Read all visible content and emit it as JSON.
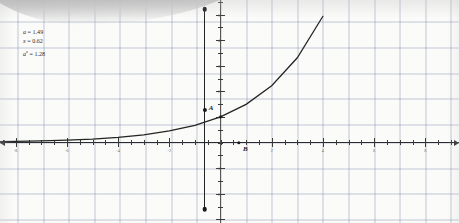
{
  "chart_data": {
    "type": "line",
    "title": "",
    "xlabel": "",
    "ylabel": "",
    "function": "y = a^x",
    "base_a": 1.49,
    "xlim": [
      -8.6,
      9.3
    ],
    "ylim": [
      -5.6,
      7.4
    ],
    "grid": true,
    "legend": false,
    "x_ticks": [
      -8,
      -6,
      -4,
      -2,
      2,
      4,
      6,
      8
    ],
    "y_ticks": [
      -5,
      -4,
      -3,
      -2,
      -1,
      1,
      2,
      3,
      4,
      5,
      6,
      7
    ],
    "x_tick_labels": [
      "-8",
      "-6",
      "-4",
      "-2",
      "2",
      "4",
      "6",
      "8"
    ],
    "y_tick_labels": [
      "-5",
      "-4",
      "-3",
      "-2",
      "-1",
      "1",
      "2",
      "3",
      "4",
      "5",
      "6",
      "7"
    ],
    "curve_points_x": [
      -8.6,
      -8,
      -7,
      -6,
      -5,
      -4,
      -3,
      -2,
      -1,
      0,
      1,
      2,
      3,
      4,
      5,
      6,
      6.6
    ],
    "curve_points_y": [
      0.03,
      0.04,
      0.06,
      0.09,
      0.13,
      0.2,
      0.3,
      0.45,
      0.67,
      1.0,
      1.49,
      2.22,
      3.31,
      4.93,
      7.35,
      10.95,
      14.3
    ],
    "series": [
      {
        "name": "y = a^x",
        "x": [
          -8.6,
          -8,
          -7,
          -6,
          -5,
          -4,
          -3,
          -2,
          -1,
          0,
          1,
          2,
          3,
          4,
          5,
          6,
          6.6
        ],
        "values": [
          0.03,
          0.04,
          0.06,
          0.09,
          0.13,
          0.2,
          0.3,
          0.45,
          0.67,
          1.0,
          1.49,
          2.22,
          3.31,
          4.93,
          7.35,
          10.95,
          14.3
        ]
      }
    ],
    "annotations": [
      {
        "name": "A",
        "label": "A",
        "x": -0.62,
        "y": 1.28,
        "style": "point-on-segment"
      },
      {
        "name": "B",
        "label": "B",
        "x": 0.72,
        "y": 0,
        "style": "point-on-x-axis"
      }
    ],
    "segments": [
      {
        "name": "vertical-slider",
        "x": -0.62,
        "y_start": 5.2,
        "y_end": -2.6,
        "endpoints": true
      }
    ]
  },
  "readout": {
    "lines": [
      {
        "name": "base-value",
        "var": "a",
        "sup": "",
        "eq": " = ",
        "value": "1.49"
      },
      {
        "name": "exponent-value",
        "var": "x",
        "sup": "",
        "eq": " = ",
        "value": "0.62"
      },
      {
        "name": "result-value",
        "var": "a",
        "sup": "x",
        "eq": " = ",
        "value": "1.28"
      }
    ],
    "line1": "a = 1.49",
    "line2": "x = 0.62",
    "line3": "aˣ = 1.28"
  },
  "points": {
    "a_label": "A",
    "b_label": "B"
  },
  "colors": {
    "curve": "#242424",
    "axis": "#2c2c2c",
    "grid_minor": "#96a0b4",
    "grid_major": "#7887a5",
    "paper": "#fbfbfa",
    "text": "#2e2e2e"
  }
}
